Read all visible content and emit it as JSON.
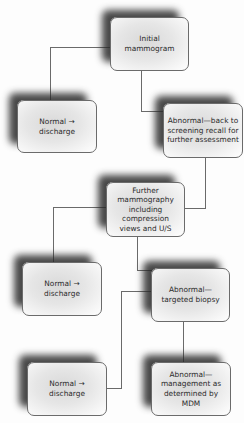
{
  "diagram": {
    "type": "flowchart",
    "nodes": [
      {
        "id": "n1",
        "label": "Initial mammogram"
      },
      {
        "id": "n2",
        "label": "Normal → discharge"
      },
      {
        "id": "n3",
        "label": "Abnormal—back to screening recall for further assessment"
      },
      {
        "id": "n4",
        "label": "Further mammography including compression views and U/S"
      },
      {
        "id": "n5",
        "label": "Normal → discharge"
      },
      {
        "id": "n6",
        "label": "Abnormal—targeted biopsy"
      },
      {
        "id": "n7",
        "label": "Normal → discharge"
      },
      {
        "id": "n8",
        "label": "Abnormal—management as determined by MDM"
      }
    ],
    "edges": [
      {
        "from": "n1",
        "to": "n2"
      },
      {
        "from": "n1",
        "to": "n3"
      },
      {
        "from": "n3",
        "to": "n4"
      },
      {
        "from": "n4",
        "to": "n5"
      },
      {
        "from": "n4",
        "to": "n6"
      },
      {
        "from": "n6",
        "to": "n7"
      },
      {
        "from": "n6",
        "to": "n8"
      }
    ]
  },
  "colors": {
    "box_border": "#6b6b6b",
    "box_fill_center": "#d9d9d9",
    "box_fill_edge": "#ffffff",
    "shadow": "#282828",
    "connector": "#6a6a6a",
    "text": "#2b2b2b"
  }
}
